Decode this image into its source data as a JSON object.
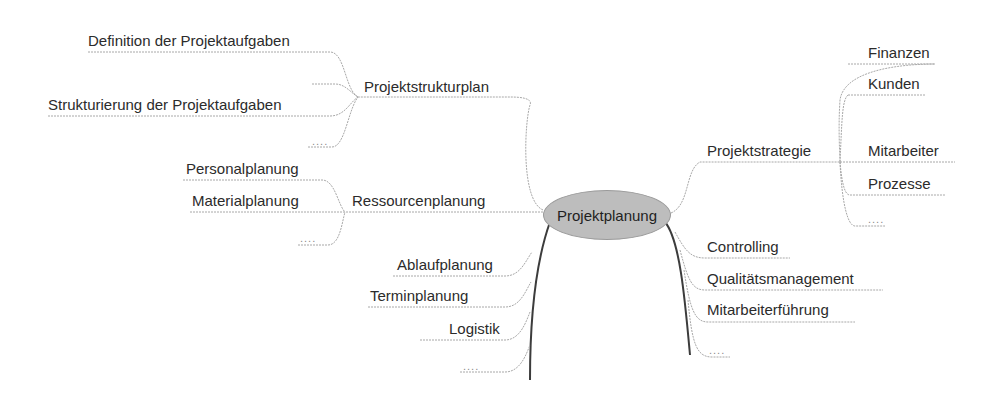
{
  "central": {
    "label": "Projektplanung",
    "fill": "#bdbdbd"
  },
  "left": {
    "projektstrukturplan": {
      "label": "Projektstrukturplan",
      "children": [
        "Definition der Projektaufgaben",
        "Strukturierung der Projektaufgaben",
        "...."
      ]
    },
    "ressourcenplanung": {
      "label": "Ressourcenplanung",
      "children": [
        "Personalplanung",
        "Materialplanung",
        "...."
      ]
    },
    "direct": [
      "Ablaufplanung",
      "Terminplanung",
      "Logistik",
      "...."
    ]
  },
  "right": {
    "projektstrategie": {
      "label": "Projektstrategie",
      "children": [
        "Finanzen",
        "Kunden",
        "Mitarbeiter",
        "Prozesse",
        "...."
      ]
    },
    "direct": [
      "Controlling",
      "Qualitätsmanagement",
      "Mitarbeiterführung",
      "...."
    ]
  },
  "colors": {
    "line": "#9a9a9a",
    "strong_line": "#444444",
    "text": "#2b2b2b"
  }
}
